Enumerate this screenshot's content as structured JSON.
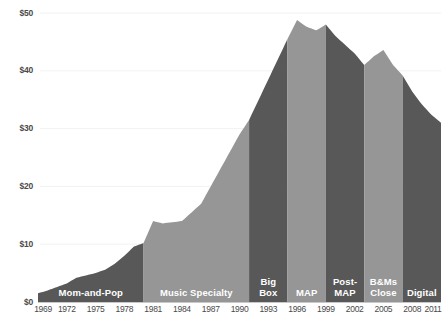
{
  "chart_data": {
    "type": "area",
    "title": "",
    "subtitle": "",
    "xlabel": "",
    "ylabel": "",
    "xlim": [
      1969,
      2011
    ],
    "ylim": [
      0,
      50
    ],
    "grid": true,
    "legend_position": "none",
    "y_ticks": [
      "$0",
      "$10",
      "$20",
      "$30",
      "$40",
      "$50"
    ],
    "y_tick_values": [
      0,
      10,
      20,
      30,
      40,
      50
    ],
    "x_ticks": [
      "1969",
      "1972",
      "1975",
      "1978",
      "1981",
      "1984",
      "1987",
      "1990",
      "1993",
      "1996",
      "1999",
      "2002",
      "2005",
      "2008",
      "2011"
    ],
    "x_tick_values": [
      1969,
      1972,
      1975,
      1978,
      1981,
      1984,
      1987,
      1990,
      1993,
      1996,
      1999,
      2002,
      2005,
      2008,
      2011
    ],
    "x": [
      1969,
      1970,
      1971,
      1972,
      1973,
      1974,
      1975,
      1976,
      1977,
      1978,
      1979,
      1980,
      1981,
      1982,
      1983,
      1984,
      1985,
      1986,
      1987,
      1988,
      1989,
      1990,
      1991,
      1992,
      1993,
      1994,
      1995,
      1996,
      1997,
      1998,
      1999,
      2000,
      2001,
      2002,
      2003,
      2004,
      2005,
      2006,
      2007,
      2008,
      2009,
      2010,
      2011
    ],
    "values": [
      1.5,
      2.0,
      2.6,
      3.2,
      4.2,
      4.6,
      5.0,
      5.6,
      6.6,
      8.0,
      9.6,
      10.2,
      14.0,
      13.6,
      13.8,
      14.0,
      15.5,
      17.0,
      20.0,
      23.0,
      26.0,
      29.0,
      31.5,
      35.0,
      38.5,
      42.0,
      45.5,
      48.8,
      47.6,
      47.0,
      48.0,
      46.0,
      44.5,
      43.0,
      41.0,
      42.5,
      43.6,
      41.0,
      39.2,
      36.4,
      34.2,
      32.4,
      31.0
    ],
    "series_name": "U.S. Recorded Music Revenue (billions)",
    "accent_dark": "#585858",
    "accent_light": "#969696",
    "grid_color": "#f2f2f2",
    "axis_rule_color": "#d0d0d0",
    "bands": [
      {
        "id": "mom-and-pop",
        "label": "Mom-and-Pop",
        "start_year": 1969,
        "end_year": 1980,
        "shade": "dark"
      },
      {
        "id": "music-specialty",
        "label": "Music Specialty",
        "start_year": 1980,
        "end_year": 1991,
        "shade": "light"
      },
      {
        "id": "big-box",
        "label": "Big\nBox",
        "start_year": 1991,
        "end_year": 1995,
        "shade": "dark"
      },
      {
        "id": "map",
        "label": "MAP",
        "start_year": 1995,
        "end_year": 1999,
        "shade": "light"
      },
      {
        "id": "post-map",
        "label": "Post-\nMAP",
        "start_year": 1999,
        "end_year": 2003,
        "shade": "dark"
      },
      {
        "id": "bms-close",
        "label": "B&Ms\nClose",
        "start_year": 2003,
        "end_year": 2007,
        "shade": "light"
      },
      {
        "id": "digital",
        "label": "Digital",
        "start_year": 2007,
        "end_year": 2011,
        "shade": "dark"
      }
    ]
  }
}
